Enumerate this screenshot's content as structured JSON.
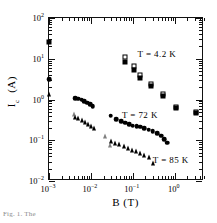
{
  "figure": {
    "caption": "Fig. 1. The"
  },
  "chart_data": {
    "type": "scatter",
    "title": "",
    "xlabel": "B  (T)",
    "ylabel": "I_c  (A)",
    "xscale": "log",
    "yscale": "log",
    "xlim": [
      0.001,
      5.0
    ],
    "ylim": [
      0.01,
      100
    ],
    "grid": false,
    "legend_position": "inline-annotations",
    "xticks": [
      0.001,
      0.01,
      0.1,
      1
    ],
    "xtick_labels": [
      "10-3",
      "10-2",
      "10-1",
      "100"
    ],
    "yticks": [
      0.01,
      0.1,
      1,
      10,
      100
    ],
    "ytick_labels": [
      "10-2",
      "10-1",
      "100",
      "101",
      "102"
    ],
    "annotations": [
      {
        "text": "T  =  4.2  K",
        "x": 0.13,
        "y": 13.0
      },
      {
        "text": "T  =  72  K",
        "x": 0.055,
        "y": 0.42
      },
      {
        "text": "T  =  85  K",
        "x": 0.3,
        "y": 0.033
      }
    ],
    "series": [
      {
        "name": "T = 4.2 K (open squares)",
        "marker": "square-open",
        "color": "#000000",
        "points": [
          {
            "x": 0.065,
            "y": 11.2
          },
          {
            "x": 0.105,
            "y": 6.6
          },
          {
            "x": 0.145,
            "y": 4.0
          },
          {
            "x": 0.27,
            "y": 2.45
          },
          {
            "x": 0.52,
            "y": 1.35
          },
          {
            "x": 1.1,
            "y": 0.66
          },
          {
            "x": 3.2,
            "y": 0.49
          }
        ]
      },
      {
        "name": "T = 4.2 K (filled squares)",
        "marker": "square-filled",
        "color": "#000000",
        "points": [
          {
            "x": 0.001,
            "y": 26.0
          },
          {
            "x": 0.065,
            "y": 8.4
          },
          {
            "x": 0.105,
            "y": 5.4
          },
          {
            "x": 0.145,
            "y": 3.4
          },
          {
            "x": 0.27,
            "y": 2.15
          },
          {
            "x": 0.52,
            "y": 1.2
          },
          {
            "x": 1.1,
            "y": 0.61
          },
          {
            "x": 3.2,
            "y": 0.46
          }
        ]
      },
      {
        "name": "T = 72 K (filled circles)",
        "marker": "circle-filled",
        "color": "#000000",
        "points": [
          {
            "x": 0.001,
            "y": 3.2
          },
          {
            "x": 0.0042,
            "y": 1.08
          },
          {
            "x": 0.005,
            "y": 1.04
          },
          {
            "x": 0.006,
            "y": 0.98
          },
          {
            "x": 0.007,
            "y": 0.92
          },
          {
            "x": 0.0082,
            "y": 0.84
          },
          {
            "x": 0.0096,
            "y": 0.76
          },
          {
            "x": 0.011,
            "y": 0.69
          },
          {
            "x": 0.03,
            "y": 0.4
          },
          {
            "x": 0.04,
            "y": 0.33
          },
          {
            "x": 0.052,
            "y": 0.295
          },
          {
            "x": 0.065,
            "y": 0.268
          },
          {
            "x": 0.082,
            "y": 0.245
          },
          {
            "x": 0.1,
            "y": 0.228
          },
          {
            "x": 0.125,
            "y": 0.222
          },
          {
            "x": 0.15,
            "y": 0.215
          },
          {
            "x": 0.19,
            "y": 0.196
          },
          {
            "x": 0.24,
            "y": 0.18
          },
          {
            "x": 0.3,
            "y": 0.165
          },
          {
            "x": 0.38,
            "y": 0.148
          },
          {
            "x": 0.47,
            "y": 0.128
          },
          {
            "x": 0.56,
            "y": 0.105
          },
          {
            "x": 0.66,
            "y": 0.088
          }
        ]
      },
      {
        "name": "T = 85 K (filled triangles)",
        "marker": "triangle-filled",
        "color": "#000000",
        "points": [
          {
            "x": 0.001,
            "y": 1.33
          },
          {
            "x": 0.0042,
            "y": 0.375
          },
          {
            "x": 0.005,
            "y": 0.345
          },
          {
            "x": 0.006,
            "y": 0.315
          },
          {
            "x": 0.0072,
            "y": 0.28
          },
          {
            "x": 0.0086,
            "y": 0.245
          },
          {
            "x": 0.01,
            "y": 0.218
          },
          {
            "x": 0.012,
            "y": 0.196
          },
          {
            "x": 0.03,
            "y": 0.098
          },
          {
            "x": 0.038,
            "y": 0.088
          },
          {
            "x": 0.048,
            "y": 0.08
          },
          {
            "x": 0.06,
            "y": 0.072
          },
          {
            "x": 0.076,
            "y": 0.064
          },
          {
            "x": 0.095,
            "y": 0.059
          },
          {
            "x": 0.12,
            "y": 0.053
          },
          {
            "x": 0.15,
            "y": 0.048
          },
          {
            "x": 0.19,
            "y": 0.043
          },
          {
            "x": 0.24,
            "y": 0.038
          },
          {
            "x": 0.3,
            "y": 0.027
          }
        ]
      },
      {
        "name": "T = 85 K (open triangles)",
        "marker": "triangle-open",
        "color": "#555555",
        "points": [
          {
            "x": 0.004,
            "y": 0.44
          },
          {
            "x": 0.0215,
            "y": 0.125
          },
          {
            "x": 0.029,
            "y": 0.076
          }
        ]
      }
    ]
  }
}
